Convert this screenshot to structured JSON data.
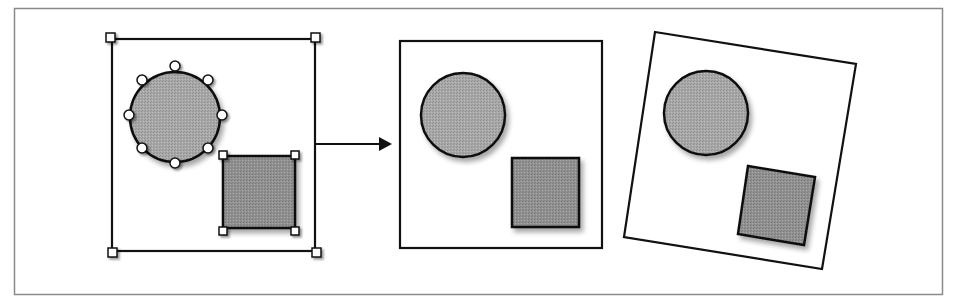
{
  "figure": {
    "colors": {
      "frame_border": "#8a8a8a",
      "stroke": "#111111",
      "circle_fill": "#a6a6a6",
      "square_fill": "#8f8f8f",
      "handle_fill": "#ffffff",
      "shadow": "#c8c8c8",
      "background": "#ffffff"
    },
    "panels": [
      {
        "id": "selected-group",
        "label": "Selected shapes with handles",
        "shapes": [
          "circle",
          "square"
        ],
        "circle_handles": 8,
        "square_handles": 4,
        "group_handles": 4
      },
      {
        "id": "grouped-object",
        "label": "Grouped object",
        "shapes": [
          "circle",
          "square"
        ]
      },
      {
        "id": "rotated-group",
        "label": "Rotated grouped object",
        "shapes": [
          "circle",
          "square"
        ],
        "rotation_deg": 9.5
      }
    ],
    "arrow": {
      "direction": "right",
      "from_panel": "selected-group",
      "to_panel": "grouped-object"
    }
  }
}
